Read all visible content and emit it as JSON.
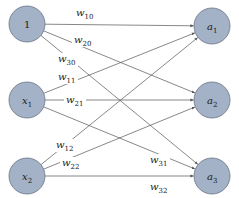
{
  "diagram": {
    "colors": {
      "node_fill": "#a3b2c6",
      "node_stroke": "#6b7585",
      "edge": "#555555",
      "background": "#ffffff"
    },
    "input_nodes": [
      {
        "id": "bias",
        "label": "1",
        "sub": "",
        "cx": 27,
        "cy": 24
      },
      {
        "id": "x1",
        "label": "x",
        "sub": "1",
        "cx": 27,
        "cy": 100
      },
      {
        "id": "x2",
        "label": "x",
        "sub": "2",
        "cx": 27,
        "cy": 176
      }
    ],
    "output_nodes": [
      {
        "id": "a1",
        "label": "a",
        "sub": "1",
        "cx": 212,
        "cy": 26
      },
      {
        "id": "a2",
        "label": "a",
        "sub": "2",
        "cx": 212,
        "cy": 100
      },
      {
        "id": "a3",
        "label": "a",
        "sub": "3",
        "cx": 212,
        "cy": 176
      }
    ],
    "weights": [
      {
        "name": "w",
        "sub": "10",
        "from": "bias",
        "to": "a1",
        "lx": 76,
        "ly": 16
      },
      {
        "name": "w",
        "sub": "20",
        "from": "bias",
        "to": "a2",
        "lx": 74,
        "ly": 43
      },
      {
        "name": "w",
        "sub": "30",
        "from": "bias",
        "to": "a3",
        "lx": 58,
        "ly": 62
      },
      {
        "name": "w",
        "sub": "11",
        "from": "x1",
        "to": "a1",
        "lx": 58,
        "ly": 80
      },
      {
        "name": "w",
        "sub": "21",
        "from": "x1",
        "to": "a2",
        "lx": 66,
        "ly": 103
      },
      {
        "name": "w",
        "sub": "31",
        "from": "x1",
        "to": "a3",
        "lx": 150,
        "ly": 163
      },
      {
        "name": "w",
        "sub": "12",
        "from": "x2",
        "to": "a1",
        "lx": 56,
        "ly": 148
      },
      {
        "name": "w",
        "sub": "22",
        "from": "x2",
        "to": "a2",
        "lx": 62,
        "ly": 166
      },
      {
        "name": "w",
        "sub": "32",
        "from": "x2",
        "to": "a3",
        "lx": 150,
        "ly": 190
      }
    ]
  }
}
